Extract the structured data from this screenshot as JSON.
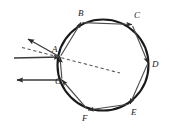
{
  "figure": {
    "background_color": "#ffffff",
    "stroke_color": "#1a1a1a",
    "ray_color": "#3a3a3a",
    "dashed_color": "#555555",
    "width": 176,
    "height": 129
  },
  "circle": {
    "label": "circle-boundary",
    "cx": 103,
    "cy": 65,
    "r": 45.5
  },
  "vertices": [
    {
      "id": "A",
      "label": "A",
      "x": 60.0,
      "y": 57.0,
      "label_x": 52.0,
      "label_y": 52.0
    },
    {
      "id": "B",
      "label": "B",
      "x": 81.0,
      "y": 22.5,
      "label_x": 78.0,
      "label_y": 16.0
    },
    {
      "id": "C",
      "label": "C",
      "x": 132.0,
      "y": 24.5,
      "label_x": 134.0,
      "label_y": 18.0
    },
    {
      "id": "D",
      "label": "D",
      "x": 148.0,
      "y": 63.0,
      "label_x": 152.0,
      "label_y": 67.0
    },
    {
      "id": "E",
      "label": "E",
      "x": 130.0,
      "y": 104.0,
      "label_x": 131.0,
      "label_y": 115.0
    },
    {
      "id": "F",
      "label": "F",
      "x": 88.0,
      "y": 110.0,
      "label_x": 82.0,
      "label_y": 121.0
    },
    {
      "id": "G",
      "label": "G",
      "x": 62.0,
      "y": 80.0,
      "label_x": 55.0,
      "label_y": 84.0
    }
  ],
  "chords": [
    {
      "name": "chord-A-B",
      "from": "A",
      "to": "B"
    },
    {
      "name": "chord-B-C",
      "from": "B",
      "to": "C"
    },
    {
      "name": "chord-C-D",
      "from": "C",
      "to": "D"
    },
    {
      "name": "chord-D-E",
      "from": "D",
      "to": "E"
    },
    {
      "name": "chord-E-F",
      "from": "E",
      "to": "F"
    },
    {
      "name": "chord-F-G",
      "from": "F",
      "to": "G"
    },
    {
      "name": "chord-G-A",
      "from": "G",
      "to": "A"
    }
  ],
  "rays": [
    {
      "name": "incident-ray",
      "x1": 14.0,
      "y1": 58.0,
      "x2": 60.0,
      "y2": 57.0,
      "arrow": "end",
      "dashed": false
    },
    {
      "name": "reflected-ray",
      "x1": 60.0,
      "y1": 57.0,
      "x2": 28.0,
      "y2": 39.0,
      "arrow": "end",
      "dashed": false
    },
    {
      "name": "exit-ray",
      "x1": 62.0,
      "y1": 80.0,
      "x2": 17.0,
      "y2": 80.0,
      "arrow": "end",
      "dashed": false
    },
    {
      "name": "normal-dashed-line",
      "x1": 22.0,
      "y1": 47.5,
      "x2": 120.0,
      "y2": 73.0,
      "arrow": "none",
      "dashed": true
    }
  ]
}
